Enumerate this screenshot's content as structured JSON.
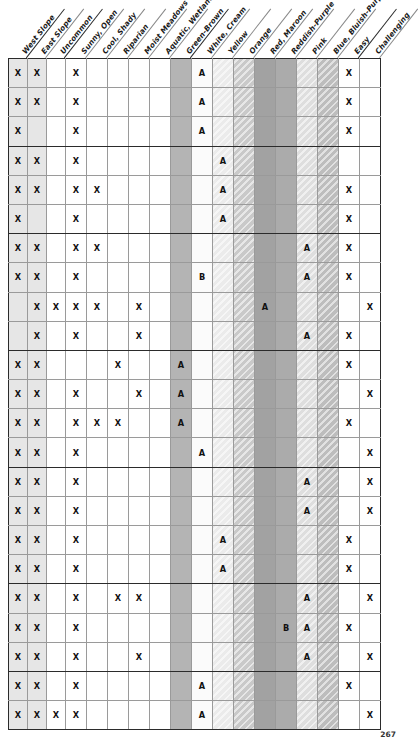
{
  "page": {
    "number": "267"
  },
  "table": {
    "columns": [
      {
        "label": "West Slope",
        "key": "west_slope",
        "tone": "t-slope",
        "hatch": false,
        "group_start": true
      },
      {
        "label": "East Slope",
        "key": "east_slope",
        "tone": "t-slope",
        "hatch": false,
        "group_start": false
      },
      {
        "label": "Uncommon",
        "key": "uncommon",
        "tone": "t-plain",
        "hatch": false,
        "group_start": true
      },
      {
        "label": "Sunny, Open",
        "key": "sunny_open",
        "tone": "t-plain",
        "hatch": false,
        "group_start": false
      },
      {
        "label": "Cool, Shady",
        "key": "cool_shady",
        "tone": "t-plain",
        "hatch": false,
        "group_start": false
      },
      {
        "label": "Riparian",
        "key": "riparian",
        "tone": "t-plain",
        "hatch": false,
        "group_start": false
      },
      {
        "label": "Moist Meadows",
        "key": "moist_meadows",
        "tone": "t-plain",
        "hatch": false,
        "group_start": false
      },
      {
        "label": "Aquatic, Wetlands",
        "key": "aquatic",
        "tone": "t-plain",
        "hatch": false,
        "group_start": false
      },
      {
        "label": "Green-Brown",
        "key": "green_brown",
        "tone": "t-greenbrown",
        "hatch": false,
        "group_start": true
      },
      {
        "label": "White, Cream",
        "key": "white_cream",
        "tone": "t-whitecream",
        "hatch": false,
        "group_start": false
      },
      {
        "label": "Yellow",
        "key": "yellow",
        "tone": "t-yellow",
        "hatch": true,
        "group_start": false
      },
      {
        "label": "Orange",
        "key": "orange",
        "tone": "t-orange",
        "hatch": true,
        "group_start": false
      },
      {
        "label": "Red, Maroon",
        "key": "red_maroon",
        "tone": "t-redmaroon",
        "hatch": false,
        "group_start": false
      },
      {
        "label": "Reddish-Purple",
        "key": "reddish_purple",
        "tone": "t-reddish",
        "hatch": false,
        "group_start": false
      },
      {
        "label": "Pink",
        "key": "pink",
        "tone": "t-pink",
        "hatch": true,
        "group_start": false
      },
      {
        "label": "Blue, Bluish-Purple",
        "key": "blue_purple",
        "tone": "t-pinkb",
        "hatch": true,
        "group_start": false
      },
      {
        "label": "Easy",
        "key": "easy",
        "tone": "t-plain",
        "hatch": false,
        "group_start": true
      },
      {
        "label": "Challenging",
        "key": "challenging",
        "tone": "t-plain",
        "hatch": false,
        "group_start": false
      }
    ],
    "marks": {
      "primary": "X",
      "rating_a": "A",
      "rating_b": "B"
    },
    "rows": [
      [
        "X",
        "X",
        "",
        "X",
        "",
        "",
        "",
        "",
        "",
        "A",
        "",
        "",
        "",
        "",
        "",
        "",
        "X",
        ""
      ],
      [
        "X",
        "X",
        "",
        "X",
        "",
        "",
        "",
        "",
        "",
        "A",
        "",
        "",
        "",
        "",
        "",
        "",
        "X",
        ""
      ],
      [
        "X",
        "",
        "",
        "X",
        "",
        "",
        "",
        "",
        "",
        "A",
        "",
        "",
        "",
        "",
        "",
        "",
        "X",
        ""
      ],
      [
        "X",
        "X",
        "",
        "X",
        "",
        "",
        "",
        "",
        "",
        "",
        "A",
        "",
        "",
        "",
        "",
        "",
        "",
        ""
      ],
      [
        "X",
        "X",
        "",
        "X",
        "X",
        "",
        "",
        "",
        "",
        "",
        "A",
        "",
        "",
        "",
        "",
        "",
        "X",
        ""
      ],
      [
        "X",
        "",
        "",
        "X",
        "",
        "",
        "",
        "",
        "",
        "",
        "A",
        "",
        "",
        "",
        "",
        "",
        "X",
        ""
      ],
      [
        "X",
        "X",
        "",
        "X",
        "X",
        "",
        "",
        "",
        "",
        "",
        "",
        "",
        "",
        "",
        "A",
        "",
        "X",
        ""
      ],
      [
        "X",
        "X",
        "",
        "X",
        "",
        "",
        "",
        "",
        "",
        "B",
        "",
        "",
        "",
        "",
        "A",
        "",
        "X",
        ""
      ],
      [
        "",
        "X",
        "X",
        "X",
        "X",
        "",
        "X",
        "",
        "",
        "",
        "",
        "",
        "A",
        "",
        "",
        "",
        "",
        "X"
      ],
      [
        "",
        "X",
        "",
        "X",
        "",
        "",
        "X",
        "",
        "",
        "",
        "",
        "",
        "",
        "",
        "A",
        "",
        "X",
        ""
      ],
      [
        "X",
        "X",
        "",
        "",
        "",
        "X",
        "",
        "",
        "A",
        "",
        "",
        "",
        "",
        "",
        "",
        "",
        "X",
        ""
      ],
      [
        "X",
        "X",
        "",
        "X",
        "",
        "",
        "X",
        "",
        "A",
        "",
        "",
        "",
        "",
        "",
        "",
        "",
        "",
        "X"
      ],
      [
        "X",
        "X",
        "",
        "X",
        "X",
        "X",
        "",
        "",
        "A",
        "",
        "",
        "",
        "",
        "",
        "",
        "",
        "X",
        ""
      ],
      [
        "X",
        "X",
        "",
        "X",
        "",
        "",
        "",
        "",
        "",
        "A",
        "",
        "",
        "",
        "",
        "",
        "",
        "",
        "X"
      ],
      [
        "X",
        "X",
        "",
        "X",
        "",
        "",
        "",
        "",
        "",
        "",
        "",
        "",
        "",
        "",
        "A",
        "",
        "",
        "X"
      ],
      [
        "X",
        "X",
        "",
        "X",
        "",
        "",
        "",
        "",
        "",
        "",
        "",
        "",
        "",
        "",
        "A",
        "",
        "",
        "X"
      ],
      [
        "X",
        "X",
        "",
        "X",
        "",
        "",
        "",
        "",
        "",
        "",
        "A",
        "",
        "",
        "",
        "",
        "",
        "X",
        ""
      ],
      [
        "X",
        "X",
        "",
        "X",
        "",
        "",
        "",
        "",
        "",
        "",
        "A",
        "",
        "",
        "",
        "",
        "",
        "X",
        ""
      ],
      [
        "X",
        "X",
        "",
        "X",
        "",
        "X",
        "X",
        "",
        "",
        "",
        "",
        "",
        "",
        "",
        "A",
        "",
        "",
        "X"
      ],
      [
        "X",
        "X",
        "",
        "X",
        "",
        "",
        "",
        "",
        "",
        "",
        "",
        "",
        "",
        "B",
        "A",
        "",
        "X",
        ""
      ],
      [
        "X",
        "X",
        "",
        "X",
        "",
        "",
        "X",
        "",
        "",
        "",
        "",
        "",
        "",
        "",
        "A",
        "",
        "",
        "X"
      ],
      [
        "X",
        "X",
        "",
        "X",
        "",
        "",
        "",
        "",
        "",
        "A",
        "",
        "",
        "",
        "",
        "",
        "",
        "X",
        ""
      ],
      [
        "X",
        "X",
        "X",
        "X",
        "",
        "",
        "",
        "",
        "",
        "A",
        "",
        "",
        "",
        "",
        "",
        "",
        "",
        "X"
      ]
    ],
    "group_breaks": [
      3,
      6,
      10,
      14,
      18,
      21,
      23
    ]
  }
}
